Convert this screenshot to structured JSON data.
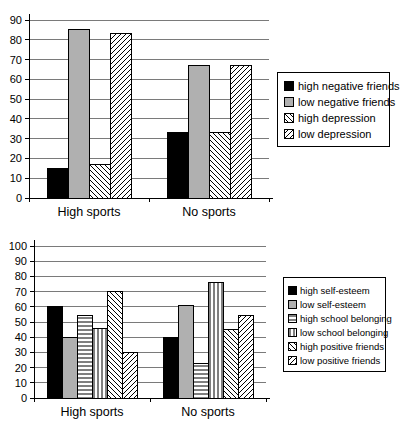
{
  "figure": {
    "background": "#ffffff"
  },
  "colors": {
    "bar_black": "#000000",
    "bar_gray": "#b0b0b0",
    "hatch_line": "#000000",
    "grid_line": "#7a7a7a",
    "axis_line": "#000000",
    "legend_border": "#000000",
    "text": "#000000"
  },
  "chart_data": [
    {
      "type": "bar",
      "title": "",
      "xlabel": "",
      "ylabel": "",
      "categories": [
        "High sports",
        "No sports"
      ],
      "series": [
        {
          "name": "high negative friends",
          "style": "solid-black",
          "values": [
            15,
            33
          ]
        },
        {
          "name": "low negative friends",
          "style": "solid-gray",
          "values": [
            85,
            67
          ]
        },
        {
          "name": "high depression",
          "style": "backslash-hatch",
          "values": [
            17,
            33
          ]
        },
        {
          "name": "low depression",
          "style": "forwardslash-hatch",
          "values": [
            83,
            67
          ]
        }
      ],
      "ylim": [
        0,
        90
      ],
      "yticks": [
        0,
        10,
        20,
        30,
        40,
        50,
        60,
        70,
        80,
        90
      ],
      "grid": true,
      "legend_position": "right"
    },
    {
      "type": "bar",
      "title": "",
      "xlabel": "",
      "ylabel": "",
      "categories": [
        "High sports",
        "No sports"
      ],
      "series": [
        {
          "name": "high self-esteem",
          "style": "solid-black",
          "values": [
            60,
            40
          ]
        },
        {
          "name": "low self-esteem",
          "style": "solid-gray",
          "values": [
            40,
            61
          ]
        },
        {
          "name": "high school belonging",
          "style": "horizontal-hatch",
          "values": [
            54,
            23
          ]
        },
        {
          "name": "low school belonging",
          "style": "vertical-hatch",
          "values": [
            46,
            76
          ]
        },
        {
          "name": "high positive friends",
          "style": "backslash-hatch",
          "values": [
            70,
            45
          ]
        },
        {
          "name": "low positive friends",
          "style": "forwardslash-hatch",
          "values": [
            30,
            54
          ]
        }
      ],
      "ylim": [
        0,
        100
      ],
      "yticks": [
        0,
        10,
        20,
        30,
        40,
        50,
        60,
        70,
        80,
        90,
        100
      ],
      "grid": true,
      "legend_position": "right"
    }
  ]
}
